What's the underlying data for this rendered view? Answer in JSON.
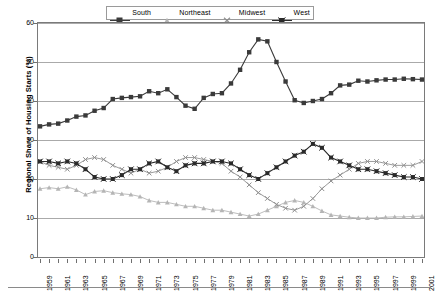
{
  "chart_data": {
    "type": "line",
    "title": "",
    "xlabel": "",
    "ylabel": "Regional Share of Housing Starts (%)",
    "ylim": [
      0,
      60
    ],
    "ytick_step": 10,
    "yticks": [
      0,
      10,
      20,
      30,
      40,
      50,
      60
    ],
    "grid": true,
    "legend_position": "top-center",
    "xlim": [
      1959,
      2001
    ],
    "x": [
      1959,
      1960,
      1961,
      1962,
      1963,
      1964,
      1965,
      1966,
      1967,
      1968,
      1969,
      1970,
      1971,
      1972,
      1973,
      1974,
      1975,
      1976,
      1977,
      1978,
      1979,
      1980,
      1981,
      1982,
      1983,
      1984,
      1985,
      1986,
      1987,
      1988,
      1989,
      1990,
      1991,
      1992,
      1993,
      1994,
      1995,
      1996,
      1997,
      1998,
      1999,
      2000,
      2001
    ],
    "xtick_labels": [
      "1959",
      "1961",
      "1963",
      "1965",
      "1967",
      "1969",
      "1971",
      "1973",
      "1975",
      "1977",
      "1979",
      "1981",
      "1983",
      "1985",
      "1987",
      "1989",
      "1991",
      "1993",
      "1995",
      "1997",
      "1999",
      "2001"
    ],
    "series": [
      {
        "name": "South",
        "marker": "square",
        "color": "#3a3a3a",
        "values": [
          33.5,
          34.0,
          34.2,
          35.0,
          36.0,
          36.3,
          37.5,
          38.2,
          40.5,
          40.8,
          41.0,
          41.2,
          42.5,
          42.0,
          43.0,
          41.0,
          38.8,
          38.0,
          40.8,
          41.8,
          42.0,
          44.5,
          48.0,
          52.5,
          55.8,
          55.3,
          50.0,
          45.0,
          40.2,
          39.5,
          40.0,
          40.5,
          42.0,
          44.0,
          44.2,
          45.2,
          45.0,
          45.3,
          45.5,
          45.5,
          45.7,
          45.6,
          45.5
        ]
      },
      {
        "name": "Northeast",
        "marker": "triangle",
        "color": "#b5b5b5",
        "values": [
          17.5,
          17.8,
          17.5,
          18.0,
          17.2,
          16.0,
          16.8,
          17.0,
          16.5,
          16.2,
          16.0,
          15.5,
          14.5,
          14.0,
          14.0,
          13.5,
          13.0,
          13.0,
          12.5,
          12.0,
          12.0,
          11.5,
          11.0,
          10.5,
          11.0,
          12.0,
          13.0,
          14.0,
          14.5,
          14.0,
          13.0,
          11.8,
          10.8,
          10.5,
          10.2,
          10.0,
          10.0,
          10.0,
          10.2,
          10.3,
          10.3,
          10.4,
          10.5
        ]
      },
      {
        "name": "Midwest",
        "marker": "x",
        "color": "#8f8f8f",
        "values": [
          24.5,
          23.5,
          23.0,
          22.5,
          23.5,
          25.0,
          25.5,
          25.0,
          23.5,
          22.5,
          21.5,
          22.5,
          21.5,
          22.0,
          23.0,
          24.5,
          25.5,
          25.5,
          25.0,
          24.5,
          24.0,
          22.0,
          20.5,
          18.5,
          16.5,
          15.0,
          13.5,
          12.5,
          12.0,
          13.0,
          15.0,
          17.5,
          19.5,
          21.0,
          22.5,
          24.0,
          24.5,
          24.5,
          24.0,
          23.5,
          23.5,
          23.5,
          24.5
        ]
      },
      {
        "name": "West",
        "marker": "star",
        "color": "#2a2a2a",
        "values": [
          24.5,
          24.5,
          24.0,
          24.5,
          24.0,
          22.5,
          20.5,
          20.0,
          20.0,
          21.0,
          22.5,
          22.5,
          24.0,
          24.5,
          23.0,
          22.0,
          23.5,
          24.0,
          24.0,
          24.5,
          24.5,
          24.0,
          22.5,
          21.0,
          20.0,
          21.5,
          23.0,
          24.5,
          26.0,
          27.0,
          29.0,
          28.0,
          25.5,
          24.5,
          23.5,
          22.5,
          22.5,
          22.0,
          21.5,
          21.0,
          20.5,
          20.5,
          20.0
        ]
      }
    ]
  },
  "legend": {
    "entries": [
      {
        "label": "South"
      },
      {
        "label": "Northeast"
      },
      {
        "label": "Midwest"
      },
      {
        "label": "West"
      }
    ]
  }
}
